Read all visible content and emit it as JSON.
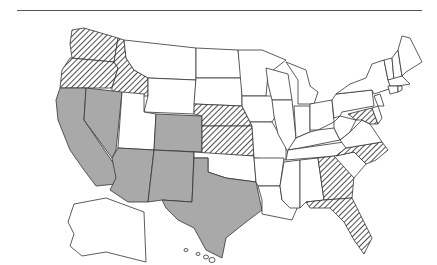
{
  "map": {
    "title": "United States",
    "colors": {
      "filled": "#a9a9a9",
      "hatched_line": "#222222",
      "empty": "#ffffff",
      "border": "#333333"
    },
    "categories": {
      "filled_gray": [
        "CA",
        "NV",
        "AZ",
        "NM",
        "CO",
        "TX"
      ],
      "hatched": [
        "WA",
        "OR",
        "ID",
        "NE",
        "KS",
        "NC",
        "GA",
        "FL",
        "MD"
      ],
      "white": [
        "MT",
        "WY",
        "UT",
        "ND",
        "SD",
        "MN",
        "IA",
        "MO",
        "OK",
        "AR",
        "LA",
        "WI",
        "IL",
        "MI",
        "IN",
        "OH",
        "KY",
        "TN",
        "MS",
        "AL",
        "SC",
        "VA",
        "WV",
        "PA",
        "NY",
        "NJ",
        "DE",
        "CT",
        "RI",
        "MA",
        "VT",
        "NH",
        "ME",
        "AK",
        "HI"
      ]
    }
  }
}
